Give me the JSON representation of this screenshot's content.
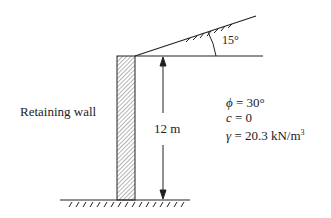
{
  "diagram": {
    "wall_label": "Retaining wall",
    "height_label": "12 m",
    "angle_label": "15°",
    "properties": [
      {
        "symbol": "ϕ",
        "value": " = 30°"
      },
      {
        "symbol": "c",
        "value": " = 0"
      },
      {
        "symbol": "γ",
        "value": " = 20.3 kN/m",
        "sup": "3"
      }
    ],
    "colors": {
      "line": "#222222",
      "background": "#ffffff"
    }
  }
}
